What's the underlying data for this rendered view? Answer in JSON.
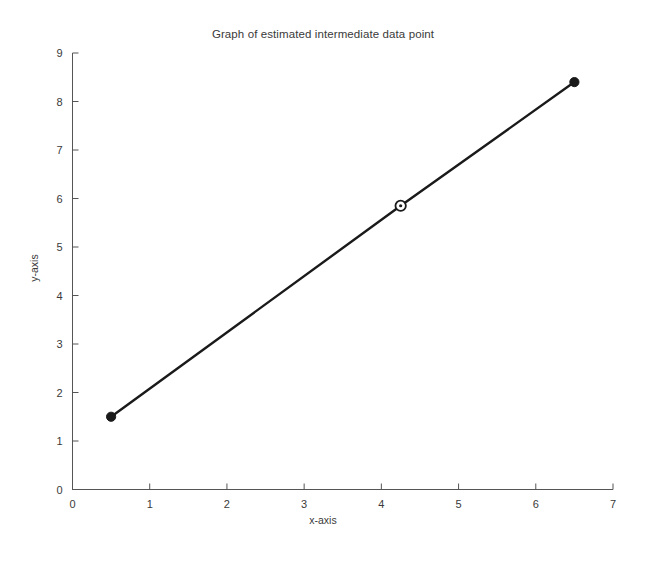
{
  "chart_data": {
    "type": "line",
    "title": "Graph of estimated intermediate data point",
    "xlabel": "x-axis",
    "ylabel": "y-axis",
    "xlim": [
      0,
      7
    ],
    "ylim": [
      0,
      9
    ],
    "xticks": [
      0,
      1,
      2,
      3,
      4,
      5,
      6,
      7
    ],
    "yticks": [
      0,
      1,
      2,
      3,
      4,
      5,
      6,
      7,
      8,
      9
    ],
    "grid": false,
    "legend": "none",
    "line_color": "#1a1a1a",
    "series": [
      {
        "name": "known data points",
        "marker": "filled-circle",
        "x": [
          0.5,
          6.5
        ],
        "y": [
          1.5,
          8.4
        ]
      },
      {
        "name": "estimated intermediate data point",
        "marker": "open-circle",
        "x": [
          4.25
        ],
        "y": [
          5.85
        ]
      }
    ],
    "points": [
      {
        "label": "left known point",
        "x": 0.5,
        "y": 1.5,
        "marker": "filled-circle"
      },
      {
        "label": "estimated intermediate point",
        "x": 4.25,
        "y": 5.85,
        "marker": "open-circle"
      },
      {
        "label": "right known point",
        "x": 6.5,
        "y": 8.4,
        "marker": "filled-circle"
      }
    ]
  },
  "figure": {
    "background": "#ffffff",
    "axis_color": "#555555"
  }
}
